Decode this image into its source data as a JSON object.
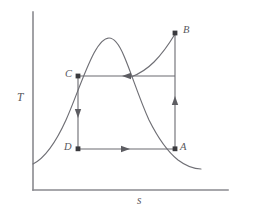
{
  "figure": {
    "type": "temperature-entropy-diagram",
    "background_color": "#ffffff",
    "width": 264,
    "height": 215
  },
  "axes": {
    "y": {
      "label": "T",
      "x_px": 33,
      "top_px": 12,
      "bottom_px": 190
    },
    "x": {
      "label": "s",
      "y_px": 190,
      "left_px": 33,
      "right_px": 228
    },
    "color": "#8a8a8f",
    "ticks": [],
    "gridlines": false
  },
  "curves": {
    "saturation_dome": {
      "name": "saturation-dome",
      "color": "#6f6f75",
      "peak": [
        108,
        38
      ],
      "left_end": [
        33,
        164
      ],
      "right_end": [
        201,
        169
      ]
    },
    "expansion": {
      "name": "expansion-curve-B-to-dome",
      "color": "#6f6f75",
      "start": [
        175,
        33
      ],
      "end": [
        131,
        80
      ]
    }
  },
  "states": [
    {
      "id": "A",
      "label": "A",
      "x": 175,
      "y": 149,
      "label_pos": "upper-right"
    },
    {
      "id": "B",
      "label": "B",
      "x": 175,
      "y": 33,
      "label_pos": "right"
    },
    {
      "id": "C",
      "label": "C",
      "x": 78,
      "y": 76,
      "label_pos": "left"
    },
    {
      "id": "D",
      "label": "D",
      "x": 78,
      "y": 149,
      "label_pos": "left"
    }
  ],
  "process_paths": [
    {
      "id": "A-to-B",
      "from": "A",
      "to": "B",
      "direction": "up",
      "arrow_at": [
        175,
        103
      ],
      "color": "#6b6b70"
    },
    {
      "id": "B-to-C",
      "from": "B",
      "to": "C",
      "direction": "left",
      "arrow_at": [
        127,
        76
      ],
      "color": "#6b6b70"
    },
    {
      "id": "C-to-D",
      "from": "C",
      "to": "D",
      "direction": "down",
      "arrow_at": [
        78,
        113
      ],
      "color": "#6b6b70"
    },
    {
      "id": "D-to-A",
      "from": "D",
      "to": "A",
      "direction": "right",
      "arrow_at": [
        125,
        149
      ],
      "color": "#6b6b70"
    }
  ],
  "colors": {
    "stroke": "#6b6b70",
    "axis": "#8a8a8f",
    "label": "#58585d",
    "dot": "#3a3a3e"
  }
}
